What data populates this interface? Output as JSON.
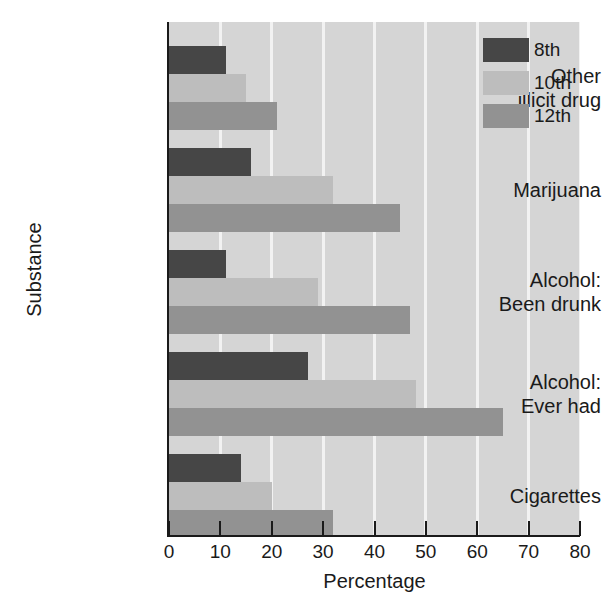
{
  "chart_data": {
    "type": "bar",
    "orientation": "horizontal",
    "title": "",
    "xlabel": "Percentage",
    "ylabel": "Substance",
    "xlim": [
      0,
      80
    ],
    "xticks": [
      0,
      10,
      20,
      30,
      40,
      50,
      60,
      70,
      80
    ],
    "grid": "vertical gridlines at every x tick",
    "legend_position": "top-right inside plot",
    "categories": [
      "Other illicit drug",
      "Marijuana",
      "Alcohol: Been drunk",
      "Alcohol: Ever had",
      "Cigarettes"
    ],
    "category_lines": [
      [
        "Other",
        "illicit drug"
      ],
      [
        "Marijuana"
      ],
      [
        "Alcohol:",
        "Been drunk"
      ],
      [
        "Alcohol:",
        "Ever had"
      ],
      [
        "Cigarettes"
      ]
    ],
    "series": [
      {
        "name": "8th",
        "color": "#464646",
        "values": [
          11,
          16,
          11,
          27,
          14
        ]
      },
      {
        "name": "10th",
        "color": "#bdbdbd",
        "values": [
          15,
          32,
          29,
          48,
          20
        ]
      },
      {
        "name": "12th",
        "color": "#929292",
        "values": [
          21,
          45,
          47,
          65,
          32
        ]
      }
    ]
  },
  "legend": {
    "entries": [
      {
        "label": "8th"
      },
      {
        "label": "10th"
      },
      {
        "label": "12th"
      }
    ]
  },
  "axes": {
    "x_title": "Percentage",
    "y_title": "Substance",
    "x_tick_labels": [
      "0",
      "10",
      "20",
      "30",
      "40",
      "50",
      "60",
      "70",
      "80"
    ]
  },
  "colors": {
    "plot_background": "#d5d5d5",
    "gridline": "#f2f2f2",
    "axis": "#1a1a1a",
    "series_8th": "#464646",
    "series_10th": "#bdbdbd",
    "series_12th": "#929292"
  }
}
